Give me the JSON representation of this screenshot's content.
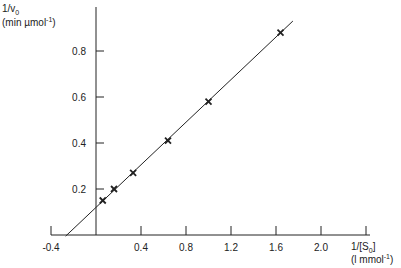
{
  "chart_data": {
    "type": "scatter",
    "title": "",
    "xlabel": "1/[S0] (l mmol⁻¹)",
    "ylabel": "1/v0 (min µmol⁻¹)",
    "xlabel_lines": [
      "1/[S",
      "0",
      "]",
      "(l mmol",
      "-1",
      ")"
    ],
    "ylabel_lines": [
      "1/v",
      "0",
      "(min µmol",
      "-1",
      ")"
    ],
    "xlim": [
      -0.4,
      2.4
    ],
    "ylim": [
      0,
      1.0
    ],
    "xticks": [
      -0.4,
      0.4,
      0.8,
      1.2,
      1.6,
      2.0,
      2.4
    ],
    "xtick_labels": [
      "-0.4",
      "0.4",
      "0.8",
      "1.2",
      "1.6",
      "2.0"
    ],
    "yticks": [
      0.2,
      0.4,
      0.6,
      0.8
    ],
    "ytick_labels": [
      "0.2",
      "0.4",
      "0.6",
      "0.8"
    ],
    "grid": false,
    "marker": "x",
    "points": [
      {
        "x": 0.06,
        "y": 0.15
      },
      {
        "x": 0.16,
        "y": 0.2
      },
      {
        "x": 0.33,
        "y": 0.27
      },
      {
        "x": 0.64,
        "y": 0.41
      },
      {
        "x": 1.0,
        "y": 0.58
      },
      {
        "x": 1.64,
        "y": 0.88
      }
    ],
    "fit_line": {
      "slope": 0.463,
      "intercept": 0.12,
      "x_start": -0.27,
      "x_end": 1.75
    },
    "colors": {
      "ink": "#222222"
    }
  }
}
